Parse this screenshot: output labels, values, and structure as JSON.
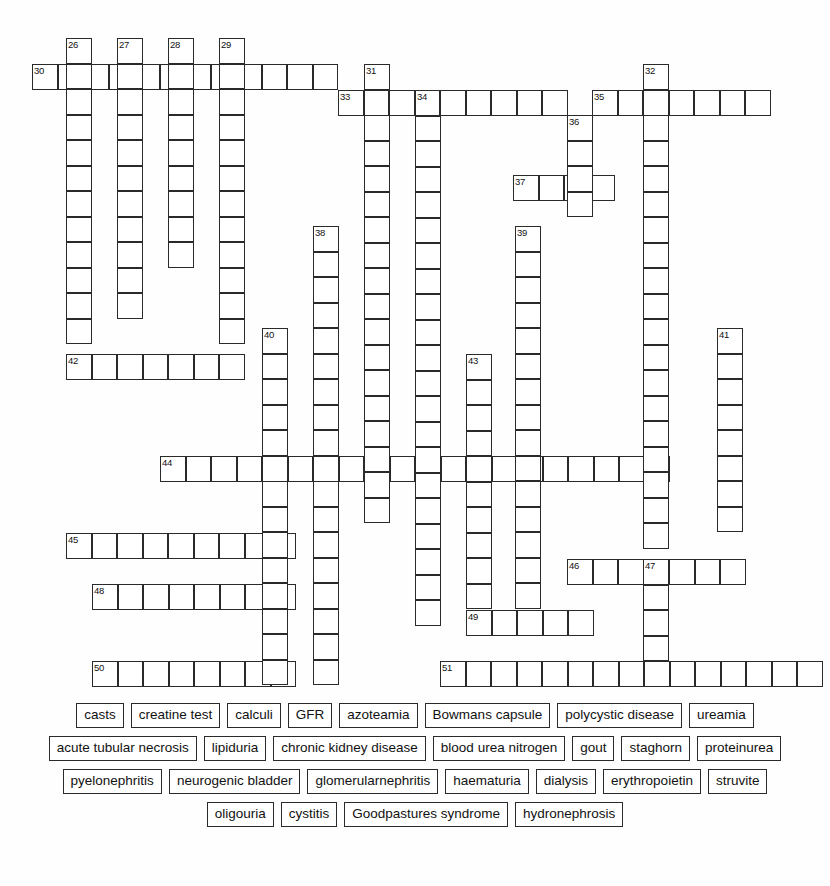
{
  "page": {
    "type": "crossword-worksheet",
    "width": 830,
    "height": 886,
    "background_color": "#ffffff",
    "line_color": "#2a2a2a",
    "cell_size": 25.5
  },
  "grid": {
    "numbers": [
      {
        "label": "26",
        "x": 66,
        "y": 38
      },
      {
        "label": "27",
        "x": 117,
        "y": 38
      },
      {
        "label": "28",
        "x": 168,
        "y": 38
      },
      {
        "label": "29",
        "x": 219,
        "y": 38
      },
      {
        "label": "30",
        "x": 32,
        "y": 64
      },
      {
        "label": "31",
        "x": 364,
        "y": 64
      },
      {
        "label": "32",
        "x": 643,
        "y": 64
      },
      {
        "label": "33",
        "x": 338,
        "y": 90
      },
      {
        "label": "34",
        "x": 415,
        "y": 90
      },
      {
        "label": "35",
        "x": 592,
        "y": 90
      },
      {
        "label": "36",
        "x": 567,
        "y": 115
      },
      {
        "label": "37",
        "x": 513,
        "y": 175
      },
      {
        "label": "38",
        "x": 313,
        "y": 226
      },
      {
        "label": "39",
        "x": 515,
        "y": 226
      },
      {
        "label": "40",
        "x": 262,
        "y": 328
      },
      {
        "label": "41",
        "x": 717,
        "y": 328
      },
      {
        "label": "42",
        "x": 66,
        "y": 354
      },
      {
        "label": "43",
        "x": 466,
        "y": 354
      },
      {
        "label": "44",
        "x": 160,
        "y": 456
      },
      {
        "label": "45",
        "x": 66,
        "y": 533
      },
      {
        "label": "46",
        "x": 567,
        "y": 559
      },
      {
        "label": "47",
        "x": 643,
        "y": 559
      },
      {
        "label": "48",
        "x": 92,
        "y": 584
      },
      {
        "label": "49",
        "x": 466,
        "y": 610
      },
      {
        "label": "50",
        "x": 92,
        "y": 661
      },
      {
        "label": "51",
        "x": 440,
        "y": 661
      }
    ],
    "across_entries": [
      {
        "number": "30",
        "x": 32,
        "y": 64,
        "length": 12
      },
      {
        "number": "33",
        "x": 338,
        "y": 90,
        "length": 9
      },
      {
        "number": "35",
        "x": 592,
        "y": 90,
        "length": 7
      },
      {
        "number": "37",
        "x": 513,
        "y": 175,
        "length": 4
      },
      {
        "number": "42",
        "x": 66,
        "y": 354,
        "length": 7
      },
      {
        "number": "44",
        "x": 160,
        "y": 456,
        "length": 20
      },
      {
        "number": "45",
        "x": 66,
        "y": 533,
        "length": 9
      },
      {
        "number": "46",
        "x": 567,
        "y": 559,
        "length": 7
      },
      {
        "number": "48",
        "x": 92,
        "y": 584,
        "length": 8
      },
      {
        "number": "49",
        "x": 466,
        "y": 610,
        "length": 5
      },
      {
        "number": "50",
        "x": 92,
        "y": 661,
        "length": 8
      },
      {
        "number": "51",
        "x": 440,
        "y": 661,
        "length": 15
      }
    ],
    "down_entries": [
      {
        "number": "26",
        "x": 66,
        "y": 38,
        "length": 12
      },
      {
        "number": "27",
        "x": 117,
        "y": 38,
        "length": 11
      },
      {
        "number": "28",
        "x": 168,
        "y": 38,
        "length": 9
      },
      {
        "number": "29",
        "x": 219,
        "y": 38,
        "length": 12
      },
      {
        "number": "31",
        "x": 364,
        "y": 64,
        "length": 18
      },
      {
        "number": "32",
        "x": 643,
        "y": 64,
        "length": 19
      },
      {
        "number": "34",
        "x": 415,
        "y": 90,
        "length": 21
      },
      {
        "number": "36",
        "x": 567,
        "y": 115,
        "length": 4
      },
      {
        "number": "38",
        "x": 313,
        "y": 226,
        "length": 18
      },
      {
        "number": "39",
        "x": 515,
        "y": 226,
        "length": 15
      },
      {
        "number": "40",
        "x": 262,
        "y": 328,
        "length": 14
      },
      {
        "number": "41",
        "x": 717,
        "y": 328,
        "length": 8
      },
      {
        "number": "43",
        "x": 466,
        "y": 354,
        "length": 10
      },
      {
        "number": "47",
        "x": 643,
        "y": 559,
        "length": 4
      }
    ]
  },
  "word_bank": {
    "rows": [
      [
        "casts",
        "creatine test",
        "calculi",
        "GFR",
        "azoteamia",
        "Bowmans capsule",
        "polycystic disease",
        "ureamia"
      ],
      [
        "acute tubular necrosis",
        "lipiduria",
        "chronic kidney disease",
        "blood urea nitrogen",
        "gout",
        "staghorn",
        "proteinurea"
      ],
      [
        "pyelonephritis",
        "neurogenic bladder",
        "glomerularnephritis",
        "haematuria",
        "dialysis",
        "erythropoietin",
        "struvite"
      ],
      [
        "oligouria",
        "cystitis",
        "Goodpastures syndrome",
        "hydronephrosis"
      ]
    ]
  }
}
